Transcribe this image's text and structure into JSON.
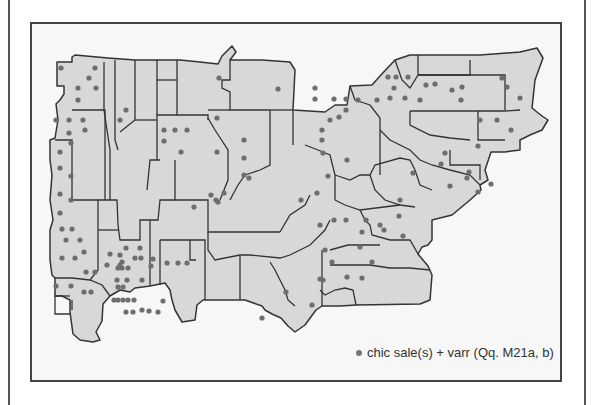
{
  "map": {
    "fill_color": "#d8d8d8",
    "border_color": "#333333",
    "dot_color": "#6e6e6e",
    "background": "#f7f7f7",
    "dots": [
      [
        61,
        68
      ],
      [
        95,
        68
      ],
      [
        89,
        78
      ],
      [
        78,
        88
      ],
      [
        96,
        88
      ],
      [
        78,
        100
      ],
      [
        83,
        120
      ],
      [
        85,
        130
      ],
      [
        126,
        110
      ],
      [
        120,
        120
      ],
      [
        164,
        130
      ],
      [
        175,
        130
      ],
      [
        187,
        130
      ],
      [
        164,
        141
      ],
      [
        181,
        152
      ],
      [
        219,
        78
      ],
      [
        278,
        89
      ],
      [
        217,
        118
      ],
      [
        244,
        140
      ],
      [
        217,
        152
      ],
      [
        244,
        158
      ],
      [
        244,
        175
      ],
      [
        211,
        195
      ],
      [
        224,
        193
      ],
      [
        249,
        178
      ],
      [
        216,
        200
      ],
      [
        194,
        207
      ],
      [
        218,
        202
      ],
      [
        315,
        88
      ],
      [
        315,
        99
      ],
      [
        334,
        99
      ],
      [
        346,
        99
      ],
      [
        346,
        110
      ],
      [
        339,
        117
      ],
      [
        330,
        120
      ],
      [
        322,
        130
      ],
      [
        322,
        140
      ],
      [
        323,
        153
      ],
      [
        347,
        160
      ],
      [
        328,
        176
      ],
      [
        317,
        193
      ],
      [
        301,
        200
      ],
      [
        320,
        225
      ],
      [
        334,
        220
      ],
      [
        346,
        220
      ],
      [
        366,
        220
      ],
      [
        362,
        232
      ],
      [
        380,
        225
      ],
      [
        400,
        200
      ],
      [
        413,
        173
      ],
      [
        435,
        84
      ],
      [
        452,
        90
      ],
      [
        388,
        77
      ],
      [
        396,
        77
      ],
      [
        408,
        77
      ],
      [
        394,
        88
      ],
      [
        426,
        85
      ],
      [
        420,
        100
      ],
      [
        390,
        98
      ],
      [
        405,
        98
      ],
      [
        358,
        100
      ],
      [
        377,
        100
      ],
      [
        462,
        87
      ],
      [
        461,
        100
      ],
      [
        502,
        78
      ],
      [
        507,
        87
      ],
      [
        520,
        98
      ],
      [
        497,
        120
      ],
      [
        480,
        120
      ],
      [
        511,
        130
      ],
      [
        478,
        146
      ],
      [
        467,
        178
      ],
      [
        469,
        172
      ],
      [
        491,
        184
      ],
      [
        445,
        153
      ],
      [
        441,
        164
      ],
      [
        450,
        186
      ],
      [
        478,
        192
      ],
      [
        384,
        230
      ],
      [
        403,
        236
      ],
      [
        399,
        216
      ],
      [
        360,
        247
      ],
      [
        372,
        262
      ],
      [
        325,
        250
      ],
      [
        332,
        262
      ],
      [
        323,
        280
      ],
      [
        320,
        279
      ],
      [
        312,
        305
      ],
      [
        262,
        318
      ],
      [
        286,
        292
      ],
      [
        347,
        277
      ],
      [
        362,
        278
      ],
      [
        56,
        120
      ],
      [
        69,
        120
      ],
      [
        69,
        133
      ],
      [
        71,
        143
      ],
      [
        60,
        152
      ],
      [
        60,
        168
      ],
      [
        71,
        176
      ],
      [
        60,
        194
      ],
      [
        71,
        200
      ],
      [
        60,
        213
      ],
      [
        62,
        229
      ],
      [
        72,
        229
      ],
      [
        66,
        240
      ],
      [
        80,
        240
      ],
      [
        62,
        258
      ],
      [
        75,
        258
      ],
      [
        56,
        286
      ],
      [
        86,
        272
      ],
      [
        71,
        286
      ],
      [
        84,
        252
      ],
      [
        120,
        255
      ],
      [
        122,
        262
      ],
      [
        135,
        258
      ],
      [
        140,
        248
      ],
      [
        126,
        248
      ],
      [
        118,
        268
      ],
      [
        118,
        287
      ],
      [
        122,
        268
      ],
      [
        123,
        287
      ],
      [
        118,
        300
      ],
      [
        123,
        300
      ],
      [
        128,
        300
      ],
      [
        134,
        300
      ],
      [
        142,
        310
      ],
      [
        158,
        312
      ],
      [
        84,
        292
      ],
      [
        91,
        292
      ],
      [
        114,
        300
      ],
      [
        149,
        311
      ],
      [
        110,
        254
      ],
      [
        95,
        272
      ],
      [
        120,
        265
      ],
      [
        153,
        259
      ],
      [
        141,
        258
      ],
      [
        151,
        266
      ],
      [
        167,
        263
      ],
      [
        178,
        263
      ],
      [
        187,
        263
      ],
      [
        142,
        280
      ],
      [
        127,
        280
      ],
      [
        117,
        280
      ],
      [
        128,
        268
      ],
      [
        107,
        265
      ],
      [
        126,
        312
      ],
      [
        133,
        312
      ],
      [
        163,
        301
      ]
    ]
  },
  "legend": {
    "text": "chic sale(s) + varr (Qq. M21a, b)"
  }
}
